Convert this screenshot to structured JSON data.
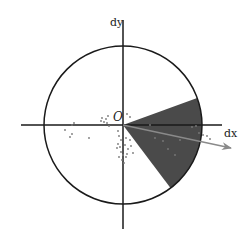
{
  "diagram": {
    "title": "",
    "labels": {
      "x_axis": "dx",
      "y_axis": "dy",
      "origin": "O"
    },
    "colors": {
      "background": "#ffffff",
      "axis": "#1a1a1a",
      "circle": "#1a1a1a",
      "sector_fill": "#4a4a4a",
      "arrow": "#8a8a8a",
      "points": "#7a7a7a"
    },
    "geometry": {
      "origin": [
        123,
        125
      ],
      "circle_radius": 79,
      "x_axis_span": [
        21,
        222
      ],
      "y_axis_span": [
        20,
        229
      ],
      "sector_start_deg": 20,
      "sector_end_deg": -53,
      "arrow_end": [
        232,
        148
      ]
    },
    "scatter_points": [
      [
        102,
        118
      ],
      [
        106,
        119
      ],
      [
        104,
        122
      ],
      [
        101,
        121
      ],
      [
        108,
        116
      ],
      [
        107,
        123
      ],
      [
        109,
        126
      ],
      [
        72,
        125
      ],
      [
        74,
        123
      ],
      [
        65,
        130
      ],
      [
        72,
        134
      ],
      [
        70,
        137
      ],
      [
        89,
        138
      ],
      [
        118,
        131
      ],
      [
        119,
        136
      ],
      [
        121,
        140
      ],
      [
        118,
        144
      ],
      [
        120,
        147
      ],
      [
        117,
        148
      ],
      [
        121,
        152
      ],
      [
        123,
        155
      ],
      [
        119,
        157
      ],
      [
        125,
        145
      ],
      [
        128,
        149
      ],
      [
        131,
        146
      ],
      [
        127,
        154
      ],
      [
        133,
        153
      ],
      [
        130,
        140
      ],
      [
        126,
        138
      ],
      [
        122,
        160
      ],
      [
        126,
        157
      ],
      [
        124,
        163
      ],
      [
        150,
        125
      ],
      [
        155,
        138
      ],
      [
        163,
        141
      ],
      [
        168,
        149
      ],
      [
        175,
        155
      ],
      [
        180,
        140
      ],
      [
        192,
        127
      ],
      [
        196,
        126
      ],
      [
        199,
        133
      ],
      [
        203,
        135
      ],
      [
        207,
        136
      ],
      [
        210,
        139
      ],
      [
        130,
        117
      ],
      [
        127,
        114
      ]
    ]
  }
}
